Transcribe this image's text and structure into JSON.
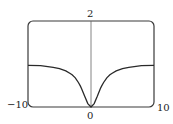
{
  "chart_data": {
    "type": "line",
    "title": "",
    "xlabel": "",
    "ylabel": "",
    "xlim": [
      -10,
      10
    ],
    "ylim": [
      0,
      2
    ],
    "grid": false,
    "legend": null,
    "tick_labels": {
      "x_min": "−10",
      "x_max": "10",
      "x_zero": "0",
      "y_max": "2"
    },
    "series": [
      {
        "name": "f(x)",
        "x": [
          -10,
          -8,
          -6,
          -5,
          -4,
          -3.3,
          -3,
          -2.5,
          -2,
          -1.7,
          -1.5,
          -1,
          -0.5,
          0,
          0.5,
          1,
          1.5,
          1.7,
          2,
          2.5,
          3,
          3.3,
          4,
          5,
          6,
          8,
          10
        ],
        "values": [
          0.97,
          0.96,
          0.92,
          0.89,
          0.84,
          0.78,
          0.75,
          0.68,
          0.57,
          0.49,
          0.43,
          0.25,
          0.08,
          0,
          0.08,
          0.25,
          0.43,
          0.49,
          0.57,
          0.68,
          0.75,
          0.78,
          0.84,
          0.89,
          0.92,
          0.96,
          0.97
        ]
      }
    ],
    "colors": {
      "curve": "#2a2a2a",
      "frame": "#3a3a3a",
      "axis": "#555555"
    }
  }
}
